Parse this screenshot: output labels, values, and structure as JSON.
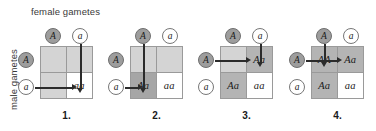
{
  "axes": {
    "female_label": "female gametes",
    "male_label": "male gametes"
  },
  "gametes": {
    "top_left": "A",
    "top_right": "a",
    "side_top": "A",
    "side_bottom": "a"
  },
  "colors": {
    "cell_white": "#ffffff",
    "cell_light": "#d4d4d4",
    "cell_mid": "#b4b4b4",
    "cell_dark": "#a6a6a6",
    "grid_line": "#9a9a9a",
    "arrow": "#2b2b2b",
    "circle_filled": "#9d9d9d",
    "circle_open": "#ffffff",
    "text": "#1a1a1a"
  },
  "squares": [
    {
      "caption": "1.",
      "cells": [
        {
          "text": "",
          "tone": "light"
        },
        {
          "text": "",
          "tone": "light"
        },
        {
          "text": "",
          "tone": "light"
        },
        {
          "text": "aa",
          "tone": "white"
        }
      ],
      "arrows": {
        "vertical_from": "a",
        "vertical_column": "right",
        "horizontal_from": "a",
        "horizontal_row": "bottom"
      }
    },
    {
      "caption": "2.",
      "cells": [
        {
          "text": "",
          "tone": "light"
        },
        {
          "text": "",
          "tone": "light"
        },
        {
          "text": "Aa",
          "tone": "dark"
        },
        {
          "text": "aa",
          "tone": "white"
        }
      ],
      "arrows": {
        "vertical_from": "A",
        "vertical_column": "left",
        "horizontal_from": "a",
        "horizontal_row": "bottom"
      }
    },
    {
      "caption": "3.",
      "cells": [
        {
          "text": "",
          "tone": "light"
        },
        {
          "text": "Aa",
          "tone": "mid"
        },
        {
          "text": "Aa",
          "tone": "mid"
        },
        {
          "text": "aa",
          "tone": "white"
        }
      ],
      "arrows": {
        "vertical_from": "a",
        "vertical_column": "right",
        "horizontal_from": "A",
        "horizontal_row": "top"
      }
    },
    {
      "caption": "4.",
      "cells": [
        {
          "text": "AA",
          "tone": "mid"
        },
        {
          "text": "Aa",
          "tone": "mid"
        },
        {
          "text": "Aa",
          "tone": "mid"
        },
        {
          "text": "aa",
          "tone": "white"
        }
      ],
      "arrows": {
        "vertical_from": "A",
        "vertical_column": "left",
        "horizontal_from": "A",
        "horizontal_row": "top"
      }
    }
  ]
}
